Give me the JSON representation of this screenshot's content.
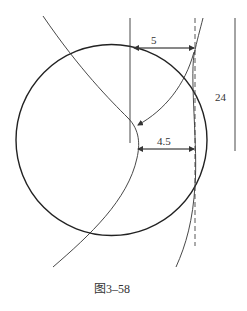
{
  "figure": {
    "caption": "图3–58",
    "dimensions": {
      "top_offset": "5",
      "inner_offset": "4.5",
      "right_length": "24"
    },
    "colors": {
      "stroke": "#222222",
      "dim_stroke": "#555555",
      "background": "#ffffff"
    }
  }
}
